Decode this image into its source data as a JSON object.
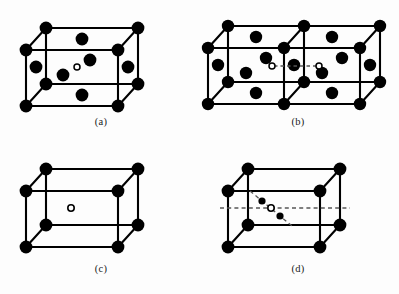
{
  "figure": {
    "kind": "crystal-lattice-diagram",
    "background_color": "#fdfdfd",
    "line_color": "#000000",
    "atom_fill_color": "#000000",
    "vacancy_stroke_color": "#000000",
    "vacancy_fill_color": "#ffffff",
    "dashed_line_color": "#555555",
    "panel_count": 4
  },
  "panels": [
    {
      "id": "a",
      "label": "(a)",
      "description": "face-centered cubic cell with interstitial site",
      "cell_type": "single-cube",
      "corner_atoms": 8,
      "face_atoms": 6,
      "interior_atoms": 2,
      "open_circles": 1,
      "dashed_segments": 0
    },
    {
      "id": "b",
      "label": "(b)",
      "description": "double face-centered cubic cell with two interstitial sites joined by dashed line",
      "cell_type": "double-cube",
      "corner_atoms": 12,
      "face_atoms": 11,
      "interior_atoms": 2,
      "open_circles": 2,
      "dashed_segments": 1
    },
    {
      "id": "c",
      "label": "(c)",
      "description": "simple cubic cell with single vacancy at body center",
      "cell_type": "single-cube",
      "corner_atoms": 8,
      "face_atoms": 0,
      "interior_atoms": 0,
      "open_circles": 1,
      "dashed_segments": 0
    },
    {
      "id": "d",
      "label": "(d)",
      "description": "simple cubic cell with body-center vacancy, horizontal dashed axis and diagonal dashed axis with two small atoms",
      "cell_type": "single-cube",
      "corner_atoms": 8,
      "face_atoms": 0,
      "interior_atoms": 2,
      "open_circles": 1,
      "dashed_segments": 2
    }
  ]
}
